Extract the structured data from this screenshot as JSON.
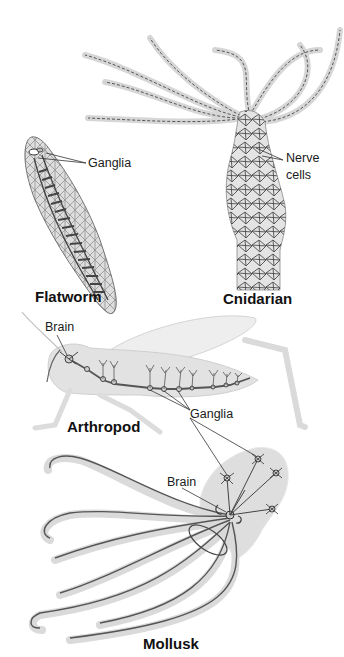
{
  "diagram": {
    "organisms": [
      {
        "name": "Flatworm",
        "labels": [
          "Ganglia"
        ]
      },
      {
        "name": "Cnidarian",
        "labels": [
          "Nerve",
          "cells"
        ]
      },
      {
        "name": "Arthropod",
        "labels": [
          "Brain",
          "Ganglia"
        ]
      },
      {
        "name": "Mollusk",
        "labels": [
          "Brain",
          "Ganglia"
        ]
      }
    ]
  },
  "flatworm": {
    "title": "Flatworm",
    "ganglia_label": "Ganglia"
  },
  "cnidarian": {
    "title": "Cnidarian",
    "nerve_label_line1": "Nerve",
    "nerve_label_line2": "cells"
  },
  "arthropod": {
    "title": "Arthropod",
    "brain_label": "Brain",
    "ganglia_label": "Ganglia"
  },
  "mollusk": {
    "title": "Mollusk",
    "brain_label": "Brain"
  },
  "colors": {
    "body_fill": "#d9d9d9",
    "nerve_stroke": "#4a4a4a",
    "label_text": "#1a1a1a"
  }
}
